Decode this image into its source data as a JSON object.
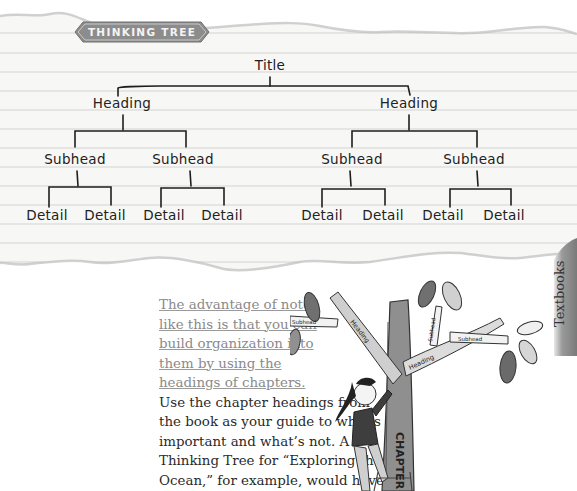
{
  "page": {
    "badge": {
      "label": "THINKING TREE",
      "color": "#8c8c8c"
    },
    "side_tab": {
      "label": "Textbooks",
      "color": "#8e8e8e"
    },
    "paper": {
      "line_color": "#cfcfcf",
      "background": "#f7f7f5"
    }
  },
  "thinking_tree": {
    "title": "Title",
    "headings": [
      {
        "label": "Heading",
        "subheads": [
          {
            "label": "Subhead",
            "details": [
              "Detail",
              "Detail"
            ]
          },
          {
            "label": "Subhead",
            "details": [
              "Detail",
              "Detail"
            ]
          }
        ]
      },
      {
        "label": "Heading",
        "subheads": [
          {
            "label": "Subhead",
            "details": [
              "Detail",
              "Detail"
            ]
          },
          {
            "label": "Subhead",
            "details": [
              "Detail",
              "Detail"
            ]
          }
        ]
      }
    ]
  },
  "body": {
    "lead": "The advantage of notes like this is that you can build organization into them by using the headings of chapters.",
    "lead_lines": [
      "The advantage of notes",
      "like this is that you can",
      "build organization into",
      "them by using the",
      "headings of chapters."
    ],
    "text_lines": [
      "Use the chapter headings from",
      "the book as your guide to what’s",
      "important and what’s not. A",
      "Thinking Tree for “Exploring the",
      "Ocean,” for example, would have",
      "two headings under the title"
    ]
  },
  "illustration": {
    "trunk_label": "CHAPTER",
    "branch_labels": [
      "Heading",
      "Heading",
      "Subhead",
      "Subhead",
      "Subhead"
    ],
    "leaf_labels": [
      "Detail",
      "Detail",
      "Detail",
      "Detail",
      "Detail",
      "Detail",
      "Detail",
      "Detail"
    ]
  }
}
